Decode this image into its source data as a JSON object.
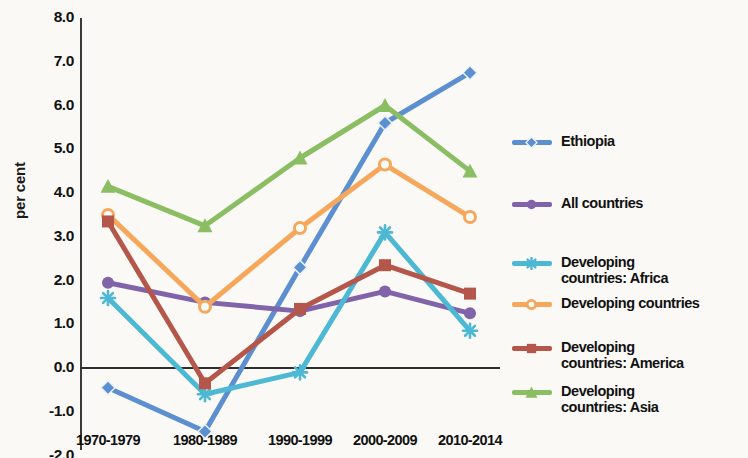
{
  "chart_data": {
    "type": "line",
    "title": "",
    "subtitle": "",
    "xlabel": "",
    "ylabel": "per cent",
    "categories": [
      "1970-1979",
      "1980-1989",
      "1990-1999",
      "2000-2009",
      "2010-2014"
    ],
    "ylim": [
      -2.0,
      8.0
    ],
    "ytick_labels": [
      "8.0",
      "7.0",
      "6.0",
      "5.0",
      "4.0",
      "3.0",
      "2.0",
      "1.0",
      "0.0",
      "-1.0",
      "-2.0"
    ],
    "ytick_values": [
      8.0,
      7.0,
      6.0,
      5.0,
      4.0,
      3.0,
      2.0,
      1.0,
      0.0,
      -1.0,
      -2.0
    ],
    "grid": false,
    "legend_position": "right",
    "zero_line": true,
    "series": [
      {
        "name": "Ethiopia",
        "legend_label": "Ethiopia",
        "color": "#5B8FD0",
        "marker": "diamond",
        "values": [
          -0.45,
          -1.45,
          2.3,
          5.6,
          6.75
        ]
      },
      {
        "name": "All countries",
        "legend_label": "All countries",
        "color": "#8063A8",
        "marker": "circle",
        "values": [
          1.95,
          1.5,
          1.3,
          1.75,
          1.25
        ]
      },
      {
        "name": "Developing countries: Africa",
        "legend_label": "Developing\ncountries: Africa",
        "color": "#4DB8D4",
        "marker": "star",
        "values": [
          1.6,
          -0.6,
          -0.1,
          3.1,
          0.85
        ]
      },
      {
        "name": "Developing countries",
        "legend_label": "Developing countries",
        "color": "#F5A85C",
        "marker": "circle-open",
        "values": [
          3.5,
          1.4,
          3.2,
          4.65,
          3.45
        ]
      },
      {
        "name": "Developing countries: America",
        "legend_label": "Developing\ncountries: America",
        "color": "#B5564A",
        "marker": "square",
        "values": [
          3.35,
          -0.35,
          1.35,
          2.35,
          1.7
        ]
      },
      {
        "name": "Developing countries: Asia",
        "legend_label": "Developing\ncountries: Asia",
        "color": "#8BBE63",
        "marker": "triangle",
        "values": [
          4.15,
          3.25,
          4.8,
          6.0,
          4.5
        ]
      }
    ]
  },
  "colors": {
    "background": "#faf9f5",
    "axis": "#2e2e2e",
    "text": "#111111"
  }
}
